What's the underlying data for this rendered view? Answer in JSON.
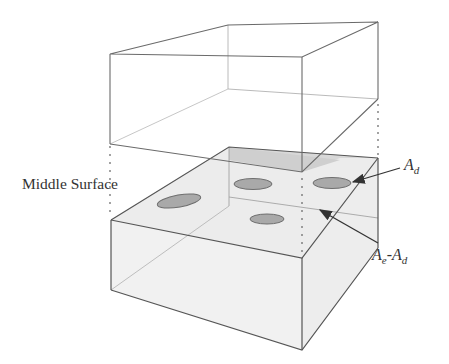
{
  "diagram": {
    "labels": {
      "middle_surface": "Middle Surface",
      "ad_main": "A",
      "ad_sub": "d",
      "ae_main": "A",
      "ae_sub": "e",
      "ae_dash": "-A",
      "ae_sub2": "d"
    },
    "colors": {
      "line": "#555555",
      "face_fill": "#f0f0f0",
      "shaded_fill": "#d6d6d6",
      "ellipse_fill": "#a8a8a8",
      "ellipse_stroke": "#707070",
      "text": "#333333"
    }
  }
}
